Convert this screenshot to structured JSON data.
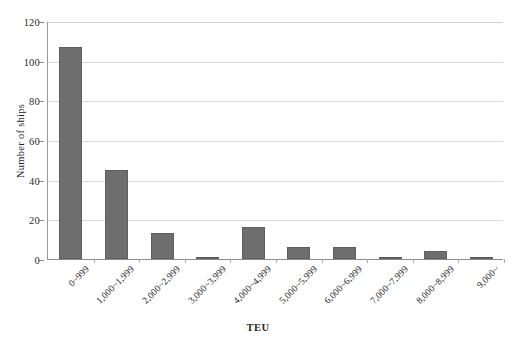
{
  "chart_data": {
    "type": "bar",
    "title": "",
    "xlabel": "TEU",
    "ylabel": "Number of ships",
    "categories": [
      "0~999",
      "1,000~1,999",
      "2,000~2,999",
      "3,000~3,999",
      "4,000~4,999",
      "5,000~5,999",
      "6,000~6,999",
      "7,000~7,999",
      "8,000~8,999",
      "9,000~"
    ],
    "values": [
      107,
      45,
      13,
      1,
      16,
      6,
      6,
      1,
      4,
      1
    ],
    "ylim": [
      0,
      120
    ],
    "ytick_labels": [
      "0",
      "20",
      "40",
      "60",
      "80",
      "100",
      "120"
    ],
    "ytick_values": [
      0,
      20,
      40,
      60,
      80,
      100,
      120
    ],
    "grid": true,
    "legend": false,
    "bar_color": "#6e6e6e",
    "grid_color": "#d9d9d9",
    "axis_color": "#8c8c8c",
    "background": "#ffffff"
  }
}
